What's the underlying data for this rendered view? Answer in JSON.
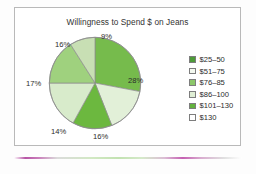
{
  "chart_data": {
    "type": "pie",
    "title": "Willingness to Spend $ on Jeans",
    "xlabel": "",
    "ylabel": "",
    "legend_position": "right",
    "grid": false,
    "categories": [
      "$25–50",
      "$51–75",
      "$76–85",
      "$86–100",
      "$101–130",
      "$130"
    ],
    "values": [
      28,
      16,
      14,
      17,
      16,
      9
    ],
    "value_labels": [
      "28%",
      "16%",
      "14%",
      "17%",
      "16%",
      "9%"
    ],
    "colors": [
      "#76bb4c",
      "#e2f0d8",
      "#6cb83f",
      "#d8ebcb",
      "#9fd17e",
      "#c8dfb4"
    ],
    "legend_swatch_colors": [
      "#4e9b39",
      "#f4f9f0",
      "#8cc76a",
      "#dfeed4",
      "#63b23d",
      "#ffffff"
    ],
    "slice_start_angle_deg": 0,
    "slices": [
      {
        "label": "$25–50",
        "value": 28,
        "value_label": "28%",
        "color": "#76bb4c"
      },
      {
        "label": "$51–75",
        "value": 16,
        "value_label": "16%",
        "color": "#e2f0d8"
      },
      {
        "label": "$76–85",
        "value": 14,
        "value_label": "14%",
        "color": "#6cb83f"
      },
      {
        "label": "$86–100",
        "value": 17,
        "value_label": "17%",
        "color": "#d8ebcb"
      },
      {
        "label": "$101–130",
        "value": 16,
        "value_label": "16%",
        "color": "#9fd17e"
      },
      {
        "label": "$130",
        "value": 9,
        "value_label": "9%",
        "color": "#c8dfb4"
      }
    ]
  },
  "chart": {
    "title": "Willingness to Spend $ on Jeans",
    "labels": {
      "l28": "28%",
      "l16a": "16%",
      "l14": "14%",
      "l17": "17%",
      "l16b": "16%",
      "l9": "9%"
    }
  },
  "legend": {
    "items": [
      {
        "label": "$25–50",
        "swatch": "#4e9b39"
      },
      {
        "label": "$51–75",
        "swatch": "#f4f9f0"
      },
      {
        "label": "$76–85",
        "swatch": "#8cc76a"
      },
      {
        "label": "$86–100",
        "swatch": "#dfeed4"
      },
      {
        "label": "$101–130",
        "swatch": "#63b23d"
      },
      {
        "label": "$130",
        "swatch": "#ffffff"
      }
    ]
  }
}
